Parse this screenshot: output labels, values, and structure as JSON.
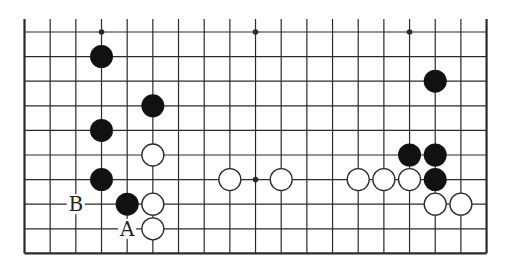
{
  "diagram": {
    "type": "go-board-partial",
    "board_size": 19,
    "visible_rows": 10,
    "edges": [
      "left",
      "right",
      "bottom"
    ],
    "colors": {
      "line": "#2a2a2a",
      "black": "#111111",
      "white": "#ffffff",
      "background": "#ffffff"
    },
    "star_points": [
      [
        4,
        1
      ],
      [
        10,
        1
      ],
      [
        16,
        1
      ],
      [
        10,
        7
      ]
    ],
    "stones": {
      "black": [
        [
          4,
          2
        ],
        [
          6,
          4
        ],
        [
          4,
          5
        ],
        [
          4,
          7
        ],
        [
          5,
          8
        ],
        [
          17,
          3
        ],
        [
          16,
          6
        ],
        [
          17,
          6
        ],
        [
          17,
          7
        ]
      ],
      "white": [
        [
          6,
          6
        ],
        [
          6,
          8
        ],
        [
          6,
          9
        ],
        [
          9,
          7
        ],
        [
          11,
          7
        ],
        [
          14,
          7
        ],
        [
          15,
          7
        ],
        [
          16,
          7
        ],
        [
          17,
          8
        ],
        [
          18,
          8
        ]
      ]
    },
    "labels": [
      {
        "text": "B",
        "col": 3,
        "row": 8
      },
      {
        "text": "A",
        "col": 5,
        "row": 9
      }
    ]
  }
}
